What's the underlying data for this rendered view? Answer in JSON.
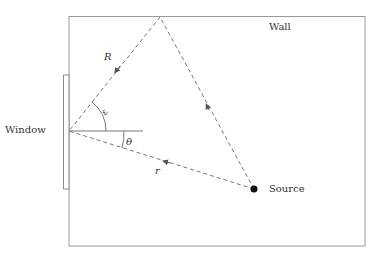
{
  "labels": {
    "wall": "Wall",
    "window": "Window",
    "source": "Source",
    "R": "R",
    "r": "r",
    "theta": "θ",
    "phi": "ε"
  },
  "colors": {
    "line": "#8a8a8a",
    "dash": "#777777",
    "dot": "#111111",
    "text": "#333333"
  }
}
